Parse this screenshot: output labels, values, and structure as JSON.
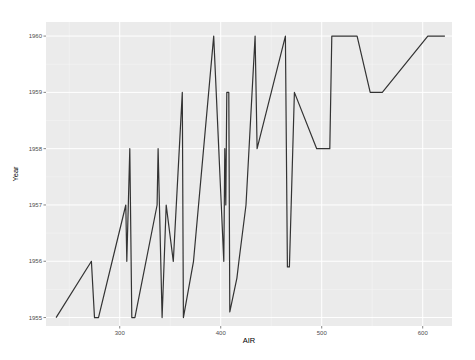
{
  "chart_data": {
    "type": "line",
    "title": "",
    "xlabel": "AIR",
    "ylabel": "Year",
    "xlim": [
      227,
      629
    ],
    "ylim": [
      1954.85,
      1960.25
    ],
    "x_ticks": [
      300,
      400,
      500,
      600
    ],
    "x_tick_labels": [
      "300",
      "400",
      "500",
      "600"
    ],
    "y_ticks": [
      1955,
      1956,
      1957,
      1958,
      1959,
      1960
    ],
    "y_tick_labels": [
      "1955",
      "1956",
      "1957",
      "1958",
      "1959",
      "1960"
    ],
    "grid": true,
    "legend": null,
    "series": [
      {
        "name": "Year vs AIR",
        "color": "#333333",
        "points": [
          [
            237,
            1955
          ],
          [
            272,
            1956
          ],
          [
            275,
            1955
          ],
          [
            279,
            1955
          ],
          [
            306,
            1957
          ],
          [
            307,
            1956
          ],
          [
            310,
            1958
          ],
          [
            312,
            1955
          ],
          [
            315,
            1955
          ],
          [
            337,
            1957
          ],
          [
            338,
            1958
          ],
          [
            342,
            1955
          ],
          [
            346,
            1957
          ],
          [
            353,
            1956
          ],
          [
            362,
            1959
          ],
          [
            363,
            1955
          ],
          [
            373,
            1956
          ],
          [
            393,
            1960
          ],
          [
            403,
            1956
          ],
          [
            404,
            1958
          ],
          [
            405,
            1957
          ],
          [
            406,
            1959
          ],
          [
            408,
            1959
          ],
          [
            409,
            1955.1
          ],
          [
            416,
            1955.7
          ],
          [
            418,
            1956
          ],
          [
            425,
            1957
          ],
          [
            434,
            1960
          ],
          [
            436,
            1958
          ],
          [
            464,
            1960
          ],
          [
            466,
            1955.9
          ],
          [
            468,
            1955.9
          ],
          [
            473,
            1959
          ],
          [
            495,
            1958
          ],
          [
            508,
            1958
          ],
          [
            510,
            1960
          ],
          [
            535,
            1960
          ],
          [
            548,
            1959
          ],
          [
            560,
            1959
          ],
          [
            605,
            1960
          ],
          [
            622,
            1960
          ]
        ]
      }
    ]
  },
  "colors": {
    "panel_background": "#ebebeb",
    "grid_major": "#ffffff",
    "line": "#333333"
  }
}
